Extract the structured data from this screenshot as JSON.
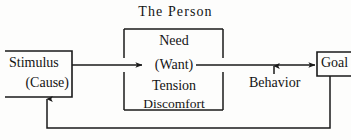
{
  "diagram": {
    "title": "The Person",
    "type": "flow-diagram",
    "background_color": "#fdfdfc",
    "line_color": "#1a1a1a",
    "text_color": "#141414",
    "nodes": {
      "stimulus": {
        "line1": "Stimulus",
        "line2": "(Cause)"
      },
      "person": {
        "line1": "Need",
        "line2": "(Want)",
        "line3": "Tension",
        "line4": "Discomfort"
      },
      "behavior": {
        "label": "Behavior"
      },
      "goal": {
        "label": "Goal"
      }
    },
    "connectors": {
      "stimulus_to_person": "arrow-right",
      "person_to_goal": "arrow-right",
      "behavior_to_flow": "arrow-up",
      "goal_feedback_to_stimulus": "arrow-up"
    }
  }
}
